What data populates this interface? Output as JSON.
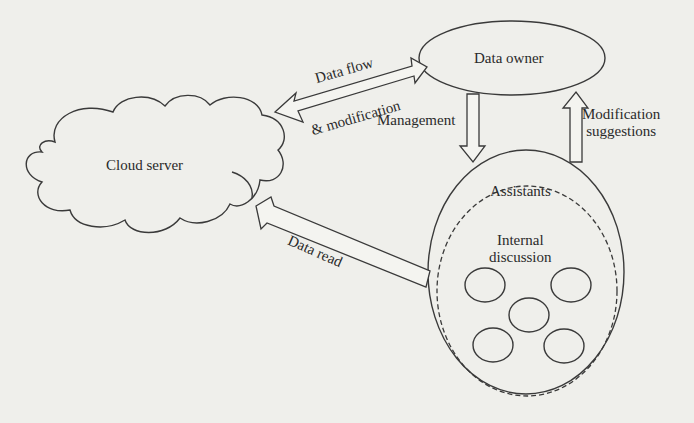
{
  "diagram": {
    "nodes": {
      "data_owner": {
        "label": "Data owner"
      },
      "cloud_server": {
        "label": "Cloud server"
      },
      "assistants": {
        "label": "Assistants"
      },
      "internal_discussion": {
        "label_line1": "Internal",
        "label_line2": "discussion",
        "member_count": 5
      }
    },
    "edges": {
      "data_flow": {
        "line1": "Data flow",
        "line2": "& modification",
        "direction": "bidirectional",
        "from": "Cloud server",
        "to": "Data owner"
      },
      "management": {
        "label": "Management",
        "from": "Data owner",
        "to": "Assistants"
      },
      "modification_suggestions": {
        "line1": "Modification",
        "line2": "suggestions",
        "from": "Assistants",
        "to": "Data owner"
      },
      "data_read": {
        "label": "Data read",
        "from": "Assistants",
        "to": "Cloud server"
      }
    },
    "colors": {
      "background": "#efefeb",
      "stroke": "#3a3a3a",
      "text": "#2a2a2a"
    }
  }
}
